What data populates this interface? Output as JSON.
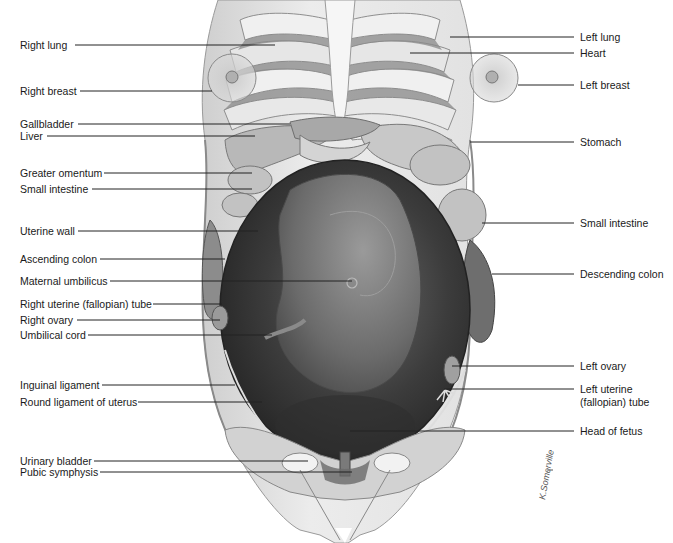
{
  "figure": {
    "colors": {
      "background": "#ffffff",
      "skin": "#e6e6e6",
      "skin_shadow": "#bdbdbd",
      "rib": "#efefef",
      "rib_shadow": "#9e9e9e",
      "uterus_dark": "#3a3a3a",
      "uterus_mid": "#5c5c5c",
      "fetus": "#7d7d7d",
      "organ": "#a8a8a8",
      "leader_line": "#222222",
      "label_text": "#1a1a1a"
    },
    "signature": "K.Somerville"
  },
  "labels_left": [
    {
      "text": "Right lung",
      "y": 45,
      "line_to": [
        275,
        45
      ]
    },
    {
      "text": "Right breast",
      "y": 91,
      "line_to": [
        212,
        91
      ]
    },
    {
      "text": "Gallbladder",
      "y": 124,
      "line_to": [
        290,
        124
      ]
    },
    {
      "text": "Liver",
      "y": 136,
      "line_to": [
        255,
        136
      ]
    },
    {
      "text": "Greater omentum",
      "y": 173,
      "line_to": [
        252,
        173
      ]
    },
    {
      "text": "Small intestine",
      "y": 189,
      "line_to": [
        252,
        189
      ]
    },
    {
      "text": "Uterine wall",
      "y": 231,
      "line_to": [
        258,
        231
      ]
    },
    {
      "text": "Ascending colon",
      "y": 259,
      "line_to": [
        225,
        259
      ]
    },
    {
      "text": "Maternal umbilicus",
      "y": 281,
      "line_to": [
        352,
        281
      ]
    },
    {
      "text": "Right uterine (fallopian) tube",
      "y": 304,
      "line_to": [
        222,
        304
      ]
    },
    {
      "text": "Right ovary",
      "y": 320,
      "line_to": [
        220,
        320
      ]
    },
    {
      "text": "Umbilical cord",
      "y": 335,
      "line_to": [
        272,
        335
      ]
    },
    {
      "text": "Inguinal ligament",
      "y": 385,
      "line_to": [
        235,
        385
      ]
    },
    {
      "text": "Round ligament of uterus",
      "y": 402,
      "line_to": [
        262,
        402
      ]
    },
    {
      "text": "Urinary bladder",
      "y": 461,
      "line_to": [
        308,
        461
      ]
    },
    {
      "text": "Pubic symphysis",
      "y": 472,
      "line_to": [
        352,
        472
      ]
    }
  ],
  "labels_right": [
    {
      "text": "Left lung",
      "y": 37,
      "line_from": [
        450,
        37
      ]
    },
    {
      "text": "Heart",
      "y": 53,
      "line_from": [
        410,
        53
      ]
    },
    {
      "text": "Left breast",
      "y": 85,
      "line_from": [
        518,
        85
      ]
    },
    {
      "text": "Stomach",
      "y": 142,
      "line_from": [
        470,
        142
      ]
    },
    {
      "text": "Small intestine",
      "y": 223,
      "line_from": [
        482,
        223
      ]
    },
    {
      "text": "Descending colon",
      "y": 274,
      "line_from": [
        492,
        274
      ]
    },
    {
      "text": "Left ovary",
      "y": 366,
      "line_from": [
        452,
        366
      ]
    },
    {
      "text": "Left uterine\n(fallopian) tube",
      "line1": "Left uterine",
      "line2": "(fallopian) tube",
      "y": 389,
      "line_from": [
        444,
        389
      ]
    },
    {
      "text": "Head of fetus",
      "y": 431,
      "line_from": [
        350,
        431
      ]
    }
  ]
}
